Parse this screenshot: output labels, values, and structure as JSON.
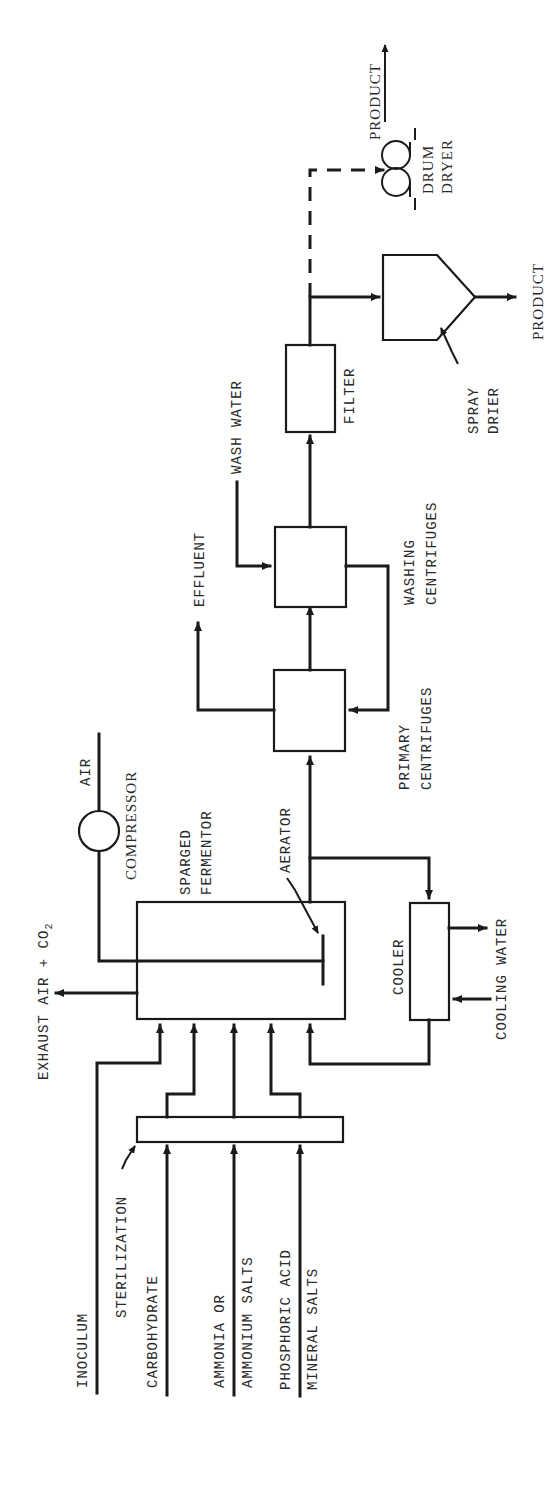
{
  "diagram": {
    "title": "",
    "orientation": "rotated-90-ccw",
    "units": {
      "sterilization": "STERILIZATION",
      "fermentor_line1": "SPARGED",
      "fermentor_line2": "FERMENTOR",
      "aerator": "AERATOR",
      "compressor": "COMPRESSOR",
      "cooler": "COOLER",
      "primary_centrifuges_line1": "PRIMARY",
      "primary_centrifuges_line2": "CENTRIFUGES",
      "washing_centrifuges_line1": "WASHING",
      "washing_centrifuges_line2": "CENTRIFUGES",
      "filter": "FILTER",
      "spray_drier_line1": "SPRAY",
      "spray_drier_line2": "DRIER",
      "drum_dryer_line1": "DRUM",
      "drum_dryer_line2": "DRYER"
    },
    "streams": {
      "inoculum": "INOCULUM",
      "carbohydrate": "CARBOHYDRATE",
      "ammonia_line1": "AMMONIA OR",
      "ammonia_line2": "AMMONIUM SALTS",
      "phosphoric_acid": "PHOSPHORIC ACID",
      "mineral_salts": "MINERAL SALTS",
      "exhaust": "EXHAUST AIR + CO",
      "exhaust_sub": "2",
      "air": "AIR",
      "cooling_water": "COOLING WATER",
      "effluent": "EFFLUENT",
      "wash_water": "WASH WATER",
      "product_spray": "PRODUCT",
      "product_drum": "PRODUCT"
    },
    "colors": {
      "ink": "#1a1a1a",
      "background": "#ffffff"
    }
  }
}
